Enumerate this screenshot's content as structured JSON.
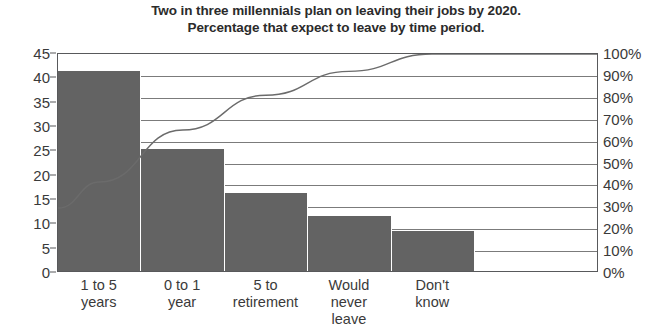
{
  "chart_data": {
    "type": "bar",
    "title": "Two in three millennials plan on leaving their jobs by 2020. Percentage that expect to leave by time period.",
    "title_lines": [
      "Two in three millennials plan on leaving their jobs by 2020.",
      "Percentage that expect to leave by time period."
    ],
    "categories": [
      "1 to 5 years",
      "0 to 1 year",
      "5 to retirement",
      "Would never leave",
      "Don't know"
    ],
    "category_lines": [
      [
        "1 to 5",
        "years"
      ],
      [
        "0 to 1",
        "year"
      ],
      [
        "5 to",
        "retirement"
      ],
      [
        "Would",
        "never",
        "leave"
      ],
      [
        "Don't",
        "know"
      ]
    ],
    "values": [
      41,
      25,
      16,
      11.3,
      8.3
    ],
    "series": [
      {
        "name": "Percentage that expect to leave",
        "type": "bar",
        "axis": "left",
        "values": [
          41,
          25,
          16,
          11.3,
          8.3
        ]
      },
      {
        "name": "Cumulative percentage",
        "type": "line",
        "axis": "right",
        "values": [
          41,
          65,
          81,
          92,
          100
        ]
      }
    ],
    "xlabel": "",
    "ylabel": "",
    "ylim": [
      0,
      45
    ],
    "ytick_values": [
      0,
      5,
      10,
      15,
      20,
      25,
      30,
      35,
      40,
      45
    ],
    "ytick_labels": [
      "0",
      "5",
      "10",
      "15",
      "20",
      "25",
      "30",
      "35",
      "40",
      "45"
    ],
    "y2lim": [
      0,
      100
    ],
    "y2tick_values": [
      0,
      10,
      20,
      30,
      40,
      50,
      60,
      70,
      80,
      90,
      100
    ],
    "y2tick_labels": [
      "0%",
      "10%",
      "20%",
      "30%",
      "40%",
      "50%",
      "60%",
      "70%",
      "80%",
      "90%",
      "100%"
    ],
    "grid": true,
    "grid_axis": "y2",
    "legend": "none",
    "colors": {
      "bar": "#636363",
      "line": "#6b6b6b",
      "axis": "#58595b",
      "grid": "#7b7b7b",
      "title_text": "#2b2b2b",
      "tick_text": "#3a3a3a",
      "background": "#ffffff"
    }
  }
}
